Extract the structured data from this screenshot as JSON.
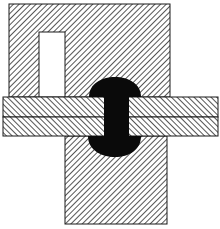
{
  "diagram": {
    "colors": {
      "background": "#ffffff",
      "hatch": "#2a2a2a",
      "outline": "#1a1a1a",
      "rivet": "#0a0a0a"
    },
    "parts": [
      {
        "id": "top-block",
        "hatch": "forward"
      },
      {
        "id": "slot"
      },
      {
        "id": "upper-plate",
        "hatch": "back"
      },
      {
        "id": "lower-plate",
        "hatch": "back"
      },
      {
        "id": "rivet"
      },
      {
        "id": "bottom-block",
        "hatch": "forward"
      }
    ]
  }
}
